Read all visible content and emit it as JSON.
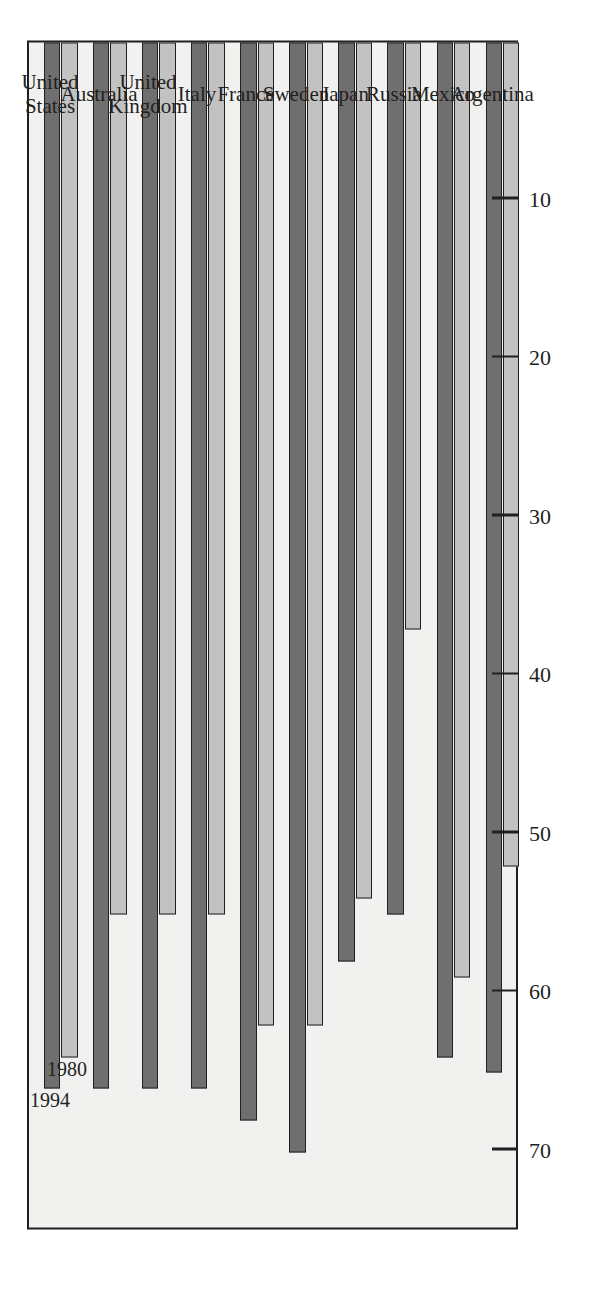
{
  "chart_data": {
    "type": "bar",
    "orientation": "horizontal",
    "title": "",
    "xlabel": "",
    "ylabel": "Services as percent of GDP",
    "axis_title": "Services as percent of GDP",
    "categories": [
      "United States",
      "Australia",
      "United Kingdom",
      "Italy",
      "France",
      "Sweden",
      "Japan",
      "Russia",
      "Mexico",
      "Argentina"
    ],
    "category_labels_multiline": [
      "United\nStates",
      "Australia",
      "United\nKingdom",
      "Italy",
      "France",
      "Sweden",
      "Japan",
      "Russia",
      "Mexico",
      "Argentina"
    ],
    "series": [
      {
        "name": "1980",
        "color": "#c2c2c2",
        "values": [
          64,
          55,
          55,
          55,
          62,
          62,
          54,
          37,
          59,
          52
        ]
      },
      {
        "name": "1994",
        "color": "#6f6f6f",
        "values": [
          66,
          66,
          66,
          66,
          68,
          70,
          58,
          55,
          64,
          65
        ]
      }
    ],
    "value_axis_ticks": [
      70,
      60,
      50,
      40,
      30,
      20,
      10
    ],
    "value_axis_tick_labels": [
      "70",
      "60",
      "50",
      "40",
      "30",
      "20",
      "10"
    ],
    "xlim": [
      0,
      75
    ],
    "grid": false,
    "legend": "inline-series-labels",
    "legend_entries": [
      "1994",
      "1980"
    ]
  },
  "style": {
    "plot_background": "#f1f1ef",
    "frame_color": "#231f20",
    "bar_1994_color": "#6f6f6f",
    "bar_1980_color": "#c2c2c2",
    "text_color": "#221f1f"
  }
}
